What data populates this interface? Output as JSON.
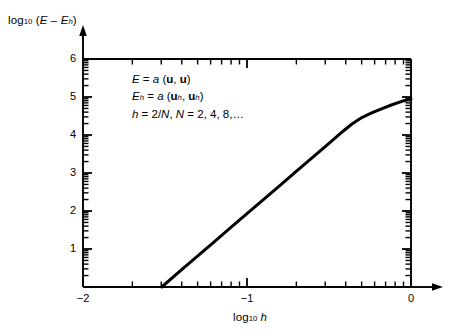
{
  "chart_data": {
    "type": "line",
    "title": "",
    "xlabel": "log10 h",
    "ylabel": "log10 (E - Eh)",
    "xlim": [
      -2,
      0
    ],
    "ylim": [
      0,
      6
    ],
    "grid": false,
    "legend": null,
    "x_ticks": [
      -2,
      -1,
      0
    ],
    "x_tick_labels": [
      "−2",
      "−1",
      "0"
    ],
    "y_ticks": [
      0,
      1,
      2,
      3,
      4,
      5,
      6
    ],
    "y_tick_labels": [
      "",
      "1",
      "2",
      "3",
      "4",
      "5",
      "6"
    ],
    "minor_tick_style": "logarithmic-decade",
    "series": [
      {
        "name": "error-curve",
        "points": [
          [
            -1.52,
            0.0
          ],
          [
            -1.4,
            0.45
          ],
          [
            -1.3,
            0.82
          ],
          [
            -1.2,
            1.19
          ],
          [
            -1.1,
            1.56
          ],
          [
            -1.0,
            1.93
          ],
          [
            -0.9,
            2.3
          ],
          [
            -0.8,
            2.67
          ],
          [
            -0.7,
            3.04
          ],
          [
            -0.6,
            3.41
          ],
          [
            -0.5,
            3.78
          ],
          [
            -0.42,
            4.08
          ],
          [
            -0.36,
            4.29
          ],
          [
            -0.3,
            4.46
          ],
          [
            -0.24,
            4.58
          ],
          [
            -0.18,
            4.69
          ],
          [
            -0.12,
            4.79
          ],
          [
            -0.06,
            4.88
          ],
          [
            0.0,
            4.95
          ]
        ]
      }
    ],
    "annotations": [
      "E = a (u, u)",
      "Eh = a (uh, uh)",
      "h = 2/N,  N = 2, 4, 8,…"
    ]
  },
  "axes": {
    "y_axis_label": "log",
    "y_axis_label_sub": "10",
    "y_axis_label_expr_open": " (",
    "y_axis_label_E": "E",
    "y_axis_label_minus": " – ",
    "y_axis_label_E2": "E",
    "y_axis_label_h": "h",
    "y_axis_label_close": ")",
    "x_axis_label": "log",
    "x_axis_label_sub": "10",
    "x_axis_label_var": "h",
    "tick_labels": {
      "y": [
        "6",
        "5",
        "4",
        "3",
        "2",
        "1"
      ],
      "x": [
        "−2",
        "−1",
        "0"
      ]
    }
  },
  "annotation_lines": {
    "line1": {
      "E": "E",
      "eq": " = ",
      "a": "a",
      "open": " (",
      "u1": "u",
      "comma": ", ",
      "u2": "u",
      "close": ")"
    },
    "line2": {
      "E": "E",
      "Esub": "h",
      "eq": " = ",
      "a": "a",
      "open": " (",
      "u1": "u",
      "u1sub": "h",
      "comma": ", ",
      "u2": "u",
      "u2sub": "h",
      "close": ")"
    },
    "line3": {
      "h": "h",
      "eq1": " = 2/",
      "N1": "N",
      "sep": ",   ",
      "N2": "N",
      "eq2": " = 2, 4, 8,…"
    }
  },
  "colors": {
    "ink": "#000000",
    "background": "#ffffff",
    "curve": "#000000"
  }
}
